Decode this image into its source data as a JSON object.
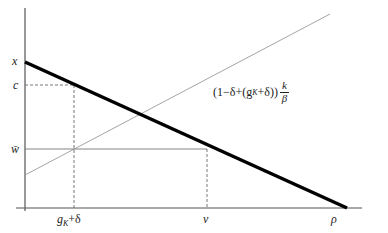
{
  "diagram": {
    "axes": {
      "y_labels": {
        "x": "x",
        "c": "c",
        "w_bar": "w̄"
      },
      "x_labels": {
        "g_delta": "g",
        "g_sub": "K",
        "g_suffix": "+δ",
        "v": "v",
        "rho": "ρ"
      }
    },
    "formula": {
      "prefix": "(1−δ+(g",
      "sub": "K",
      "suffix": "+δ))",
      "frac_num": "k",
      "frac_den": "β"
    },
    "colors": {
      "axis": "#333333",
      "thick_line": "#000000",
      "thin_line": "#9a9a9a",
      "dashed": "#555555"
    }
  }
}
